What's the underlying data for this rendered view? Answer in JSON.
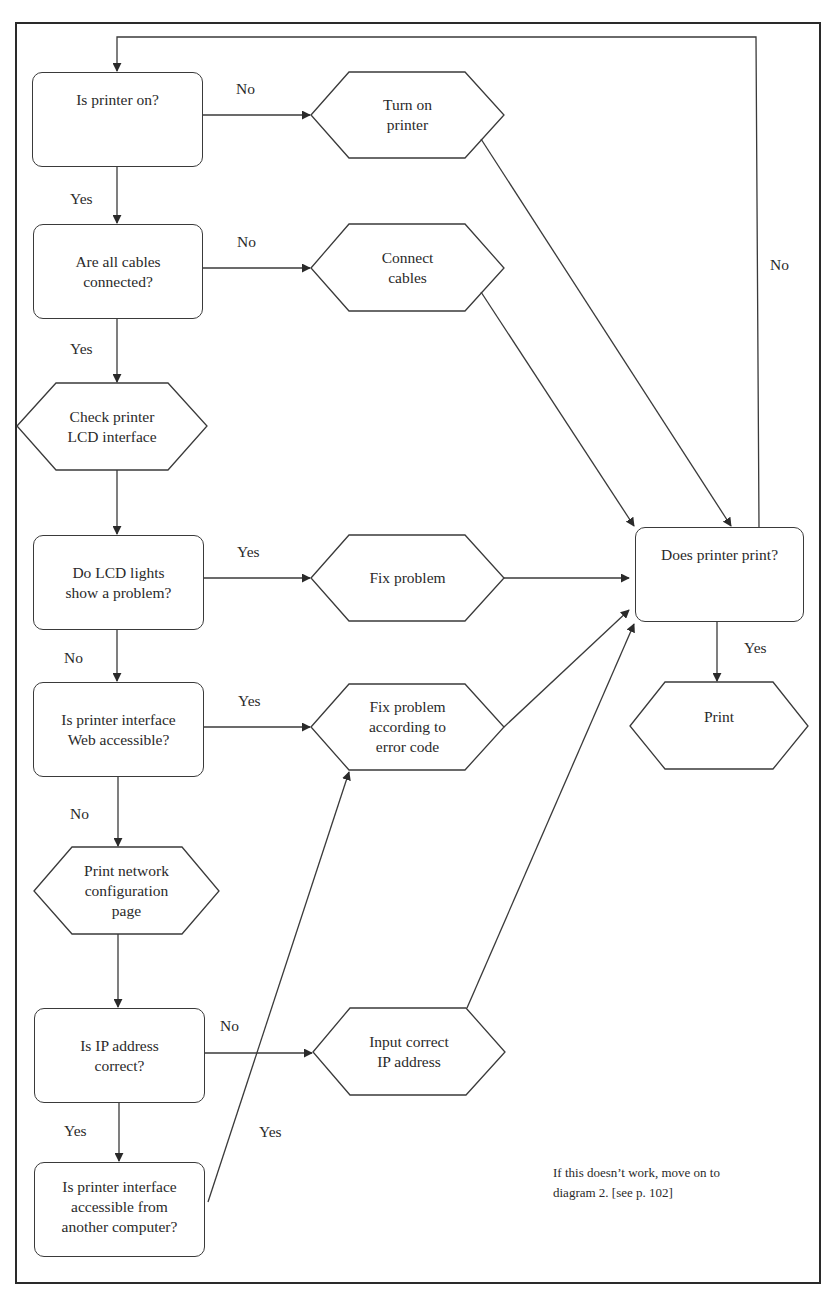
{
  "diagram": {
    "type": "flowchart",
    "nodes": {
      "printer_on": {
        "shape": "decision-box",
        "text": "Is printer on?"
      },
      "turn_on": {
        "shape": "hexagon",
        "text": "Turn on\nprinter"
      },
      "cables": {
        "shape": "decision-box",
        "text": "Are all cables\nconnected?"
      },
      "connect_cables": {
        "shape": "hexagon",
        "text": "Connect\ncables"
      },
      "check_lcd": {
        "shape": "hexagon",
        "text": "Check printer\nLCD interface"
      },
      "lcd_problem": {
        "shape": "decision-box",
        "text": "Do LCD lights\nshow a problem?"
      },
      "fix_problem": {
        "shape": "hexagon",
        "text": "Fix problem"
      },
      "web_accessible": {
        "shape": "decision-box",
        "text": "Is printer interface\nWeb accessible?"
      },
      "fix_error_code": {
        "shape": "hexagon",
        "text": "Fix problem\naccording to\nerror code"
      },
      "print_config": {
        "shape": "hexagon",
        "text": "Print network\nconfiguration\npage"
      },
      "ip_correct": {
        "shape": "decision-box",
        "text": "Is IP address\ncorrect?"
      },
      "input_ip": {
        "shape": "hexagon",
        "text": "Input correct\nIP address"
      },
      "other_computer": {
        "shape": "decision-box",
        "text": "Is printer interface\naccessible from\nanother computer?"
      },
      "does_print": {
        "shape": "decision-box",
        "text": "Does printer print?"
      },
      "print": {
        "shape": "hexagon",
        "text": "Print"
      }
    },
    "edge_labels": {
      "printer_on_no": "No",
      "printer_on_yes": "Yes",
      "cables_no": "No",
      "cables_yes": "Yes",
      "lcd_yes": "Yes",
      "lcd_no": "No",
      "web_yes": "Yes",
      "web_no": "No",
      "ip_no": "No",
      "ip_yes": "Yes",
      "other_yes": "Yes",
      "does_print_yes": "Yes",
      "does_print_no": "No"
    },
    "edges": [
      {
        "from": "printer_on",
        "to": "turn_on",
        "label": "No"
      },
      {
        "from": "printer_on",
        "to": "cables",
        "label": "Yes"
      },
      {
        "from": "cables",
        "to": "connect_cables",
        "label": "No"
      },
      {
        "from": "cables",
        "to": "check_lcd",
        "label": "Yes"
      },
      {
        "from": "check_lcd",
        "to": "lcd_problem",
        "label": ""
      },
      {
        "from": "lcd_problem",
        "to": "fix_problem",
        "label": "Yes"
      },
      {
        "from": "lcd_problem",
        "to": "web_accessible",
        "label": "No"
      },
      {
        "from": "web_accessible",
        "to": "fix_error_code",
        "label": "Yes"
      },
      {
        "from": "web_accessible",
        "to": "print_config",
        "label": "No"
      },
      {
        "from": "print_config",
        "to": "ip_correct",
        "label": ""
      },
      {
        "from": "ip_correct",
        "to": "input_ip",
        "label": "No"
      },
      {
        "from": "ip_correct",
        "to": "other_computer",
        "label": "Yes"
      },
      {
        "from": "other_computer",
        "to": "fix_error_code",
        "label": "Yes"
      },
      {
        "from": "turn_on",
        "to": "does_print",
        "label": ""
      },
      {
        "from": "connect_cables",
        "to": "does_print",
        "label": ""
      },
      {
        "from": "fix_problem",
        "to": "does_print",
        "label": ""
      },
      {
        "from": "fix_error_code",
        "to": "does_print",
        "label": ""
      },
      {
        "from": "input_ip",
        "to": "does_print",
        "label": ""
      },
      {
        "from": "does_print",
        "to": "print",
        "label": "Yes"
      },
      {
        "from": "does_print",
        "to": "printer_on",
        "label": "No"
      }
    ],
    "note": "If this doesn’t work, move on to\ndiagram 2. [see p. 102]"
  },
  "colors": {
    "line": "#3a3a3a",
    "text": "#2a2a2a",
    "background": "#ffffff"
  }
}
